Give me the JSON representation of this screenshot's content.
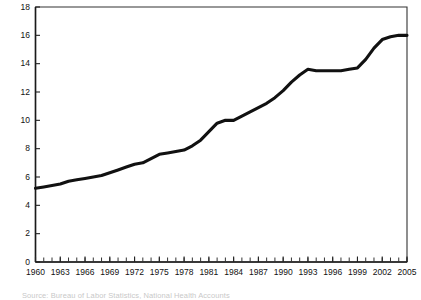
{
  "chart_data": {
    "type": "line",
    "title": "",
    "subtitle": "",
    "xlabel": "",
    "ylabel": "",
    "xlim": [
      1960,
      2005
    ],
    "ylim": [
      0,
      18
    ],
    "grid": false,
    "legend": "none",
    "y_ticks": [
      0,
      2,
      4,
      6,
      8,
      10,
      12,
      14,
      16,
      18
    ],
    "x_ticks": [
      1960,
      1963,
      1966,
      1969,
      1972,
      1975,
      1978,
      1981,
      1984,
      1987,
      1990,
      1993,
      1996,
      1999,
      2002,
      2005
    ],
    "x_tick_interval_minor": 1,
    "series": [
      {
        "name": "series-1",
        "color": "#111111",
        "x": [
          1960,
          1961,
          1962,
          1963,
          1964,
          1965,
          1966,
          1967,
          1968,
          1969,
          1970,
          1971,
          1972,
          1973,
          1974,
          1975,
          1976,
          1977,
          1978,
          1979,
          1980,
          1981,
          1982,
          1983,
          1984,
          1985,
          1986,
          1987,
          1988,
          1989,
          1990,
          1991,
          1992,
          1993,
          1994,
          1995,
          1996,
          1997,
          1998,
          1999,
          2000,
          2001,
          2002,
          2003,
          2004,
          2005
        ],
        "values": [
          5.2,
          5.3,
          5.4,
          5.5,
          5.7,
          5.8,
          5.9,
          6.0,
          6.1,
          6.3,
          6.5,
          6.7,
          6.9,
          7.0,
          7.3,
          7.6,
          7.7,
          7.8,
          7.9,
          8.2,
          8.6,
          9.2,
          9.8,
          10.0,
          10.0,
          10.3,
          10.6,
          10.9,
          11.2,
          11.6,
          12.1,
          12.7,
          13.2,
          13.6,
          13.5,
          13.5,
          13.5,
          13.5,
          13.6,
          13.7,
          14.3,
          15.1,
          15.7,
          15.9,
          16.0,
          16.0
        ]
      }
    ]
  },
  "caption": {
    "source_text": "Source: Bureau of Labor Statistics, National Health Accounts"
  }
}
